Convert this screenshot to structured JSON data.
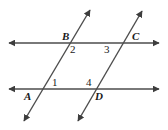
{
  "figure": {
    "background_color": "#ffffff",
    "line_color": "#4d4d4d",
    "label_color": "#1a1a1a",
    "width": 168,
    "height": 130,
    "lines": [
      {
        "name": "upper-parallel-line",
        "type": "double-arrow-line",
        "x1": 9,
        "y1": 43,
        "x2": 159,
        "y2": 43
      },
      {
        "name": "lower-parallel-line",
        "type": "double-arrow-line",
        "x1": 9,
        "y1": 89,
        "x2": 159,
        "y2": 89
      },
      {
        "name": "left-transversal-line",
        "type": "double-arrow-line",
        "x1": 24,
        "y1": 121,
        "x2": 90,
        "y2": 10
      },
      {
        "name": "right-transversal-line",
        "type": "double-arrow-line",
        "x1": 78,
        "y1": 121,
        "x2": 142,
        "y2": 11
      }
    ],
    "point_labels": [
      {
        "name": "point-label-b",
        "text": "B",
        "x": 62,
        "y": 31
      },
      {
        "name": "point-label-c",
        "text": "C",
        "x": 132,
        "y": 31
      },
      {
        "name": "point-label-a",
        "text": "A",
        "x": 24,
        "y": 91
      },
      {
        "name": "point-label-d",
        "text": "D",
        "x": 95,
        "y": 91
      }
    ],
    "angle_labels": [
      {
        "name": "angle-label-2",
        "text": "2",
        "x": 70,
        "y": 44
      },
      {
        "name": "angle-label-3",
        "text": "3",
        "x": 104,
        "y": 44
      },
      {
        "name": "angle-label-1",
        "text": "1",
        "x": 52,
        "y": 77
      },
      {
        "name": "angle-label-4",
        "text": "4",
        "x": 86,
        "y": 77
      }
    ]
  }
}
